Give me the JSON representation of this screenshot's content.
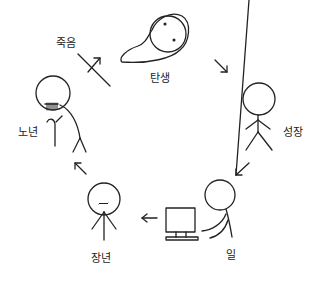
{
  "diagram": {
    "type": "life-cycle",
    "stroke_color": "#222222",
    "background": "#ffffff",
    "stages": [
      {
        "id": "birth",
        "label": "탄생",
        "figure": "egg-baby"
      },
      {
        "id": "growth",
        "label": "성장",
        "figure": "stick-figure"
      },
      {
        "id": "work",
        "label": "일",
        "figure": "person-at-computer"
      },
      {
        "id": "middle-age",
        "label": "장년",
        "figure": "stick-figure-mustache"
      },
      {
        "id": "old-age",
        "label": "노년",
        "figure": "old-person-with-cane"
      },
      {
        "id": "death",
        "label": "죽음",
        "figure": "crossed-arrow"
      }
    ],
    "flow": [
      "birth",
      "growth",
      "work",
      "middle-age",
      "old-age",
      "death",
      "birth"
    ]
  }
}
